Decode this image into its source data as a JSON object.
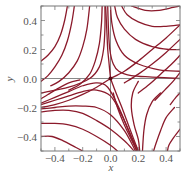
{
  "chart_data": {
    "type": "line",
    "title": "",
    "xlabel": "x",
    "ylabel": "y",
    "xlim": [
      -0.5,
      0.5
    ],
    "ylim": [
      -0.5,
      0.5
    ],
    "grid": false,
    "legend": null,
    "xticks": [
      -0.4,
      -0.2,
      0.0,
      0.2,
      0.4
    ],
    "xtick_labels": [
      "−0.4",
      "−0.2",
      "0.0",
      "0.2",
      "0.4"
    ],
    "yticks": [
      -0.4,
      -0.2,
      0.0,
      0.2,
      0.4
    ],
    "ytick_labels": [
      "−0.4",
      "−0.2",
      "0.0",
      "0.2",
      "0.4"
    ],
    "minor_tick_step": 0.1,
    "reference_lines": [
      {
        "orientation": "horizontal",
        "value": 0.0
      },
      {
        "orientation": "vertical",
        "value": 0.0
      }
    ],
    "fixed_point": {
      "x": 0.0,
      "y": 0.0,
      "kind": "saddle"
    },
    "series": [
      {
        "name": "traj-upper-left-1",
        "points": [
          [
            -0.5,
            -0.02
          ],
          [
            -0.45,
            0.02
          ],
          [
            -0.4,
            0.08
          ],
          [
            -0.35,
            0.16
          ],
          [
            -0.31,
            0.26
          ],
          [
            -0.28,
            0.38
          ],
          [
            -0.26,
            0.5
          ]
        ]
      },
      {
        "name": "traj-upper-left-2",
        "points": [
          [
            -0.43,
            -0.05
          ],
          [
            -0.37,
            -0.02
          ],
          [
            -0.3,
            0.04
          ],
          [
            -0.24,
            0.12
          ],
          [
            -0.2,
            0.22
          ],
          [
            -0.17,
            0.34
          ],
          [
            -0.15,
            0.5
          ]
        ]
      },
      {
        "name": "traj-upper-left-3",
        "points": [
          [
            -0.3,
            -0.08
          ],
          [
            -0.22,
            -0.04
          ],
          [
            -0.15,
            0.03
          ],
          [
            -0.11,
            0.12
          ],
          [
            -0.08,
            0.24
          ],
          [
            -0.065,
            0.38
          ],
          [
            -0.06,
            0.5
          ]
        ]
      },
      {
        "name": "traj-upper-left-4",
        "points": [
          [
            -0.5,
            0.12
          ],
          [
            -0.45,
            0.16
          ],
          [
            -0.4,
            0.22
          ],
          [
            -0.36,
            0.3
          ],
          [
            -0.33,
            0.4
          ],
          [
            -0.31,
            0.5
          ]
        ]
      },
      {
        "name": "traj-stable-manifold-top",
        "points": [
          [
            0.0,
            0.0
          ],
          [
            -0.01,
            0.1
          ],
          [
            -0.02,
            0.2
          ],
          [
            -0.025,
            0.3
          ],
          [
            -0.03,
            0.4
          ],
          [
            -0.035,
            0.5
          ]
        ]
      },
      {
        "name": "traj-near-manifold-left",
        "points": [
          [
            -0.04,
            0.5
          ],
          [
            -0.04,
            0.35
          ],
          [
            -0.05,
            0.2
          ],
          [
            -0.08,
            0.08
          ],
          [
            -0.15,
            0.0
          ],
          [
            -0.3,
            -0.06
          ],
          [
            -0.5,
            -0.1
          ]
        ]
      },
      {
        "name": "traj-near-manifold-right",
        "points": [
          [
            -0.02,
            0.5
          ],
          [
            -0.015,
            0.35
          ],
          [
            -0.005,
            0.2
          ],
          [
            0.02,
            0.1
          ],
          [
            0.06,
            0.05
          ],
          [
            0.15,
            0.02
          ],
          [
            0.3,
            0.01
          ],
          [
            0.5,
            0.0
          ]
        ]
      },
      {
        "name": "traj-upper-right-1",
        "points": [
          [
            0.0,
            0.5
          ],
          [
            0.01,
            0.38
          ],
          [
            0.04,
            0.26
          ],
          [
            0.1,
            0.16
          ],
          [
            0.2,
            0.1
          ],
          [
            0.35,
            0.06
          ],
          [
            0.5,
            0.05
          ]
        ]
      },
      {
        "name": "traj-upper-right-2",
        "points": [
          [
            0.03,
            0.5
          ],
          [
            0.05,
            0.42
          ],
          [
            0.1,
            0.34
          ],
          [
            0.18,
            0.27
          ],
          [
            0.3,
            0.22
          ],
          [
            0.42,
            0.2
          ],
          [
            0.5,
            0.2
          ]
        ]
      },
      {
        "name": "traj-upper-right-3",
        "points": [
          [
            0.08,
            0.5
          ],
          [
            0.12,
            0.44
          ],
          [
            0.2,
            0.39
          ],
          [
            0.3,
            0.36
          ],
          [
            0.4,
            0.36
          ],
          [
            0.5,
            0.37
          ]
        ]
      },
      {
        "name": "traj-upper-right-4",
        "points": [
          [
            0.15,
            0.5
          ],
          [
            0.25,
            0.47
          ],
          [
            0.35,
            0.47
          ],
          [
            0.45,
            0.49
          ],
          [
            0.5,
            0.5
          ]
        ]
      },
      {
        "name": "traj-unstable-manifold-right",
        "points": [
          [
            0.0,
            0.0
          ],
          [
            0.1,
            0.05
          ],
          [
            0.2,
            0.12
          ],
          [
            0.3,
            0.2
          ],
          [
            0.4,
            0.28
          ],
          [
            0.5,
            0.37
          ]
        ]
      },
      {
        "name": "traj-right-1",
        "points": [
          [
            0.1,
            -0.03
          ],
          [
            0.2,
            0.03
          ],
          [
            0.3,
            0.1
          ],
          [
            0.4,
            0.18
          ],
          [
            0.5,
            0.27
          ]
        ]
      },
      {
        "name": "traj-right-2",
        "points": [
          [
            0.2,
            -0.1
          ],
          [
            0.28,
            -0.04
          ],
          [
            0.36,
            0.03
          ],
          [
            0.44,
            0.1
          ],
          [
            0.5,
            0.16
          ]
        ]
      },
      {
        "name": "traj-right-3",
        "points": [
          [
            0.32,
            -0.15
          ],
          [
            0.39,
            -0.08
          ],
          [
            0.45,
            -0.02
          ],
          [
            0.5,
            0.04
          ]
        ]
      },
      {
        "name": "traj-right-4",
        "points": [
          [
            0.43,
            -0.18
          ],
          [
            0.47,
            -0.13
          ],
          [
            0.5,
            -0.1
          ]
        ]
      },
      {
        "name": "traj-unstable-manifold-left",
        "points": [
          [
            0.0,
            0.0
          ],
          [
            -0.1,
            -0.06
          ],
          [
            -0.2,
            -0.11
          ],
          [
            -0.3,
            -0.15
          ],
          [
            -0.4,
            -0.18
          ],
          [
            -0.5,
            -0.2
          ]
        ]
      },
      {
        "name": "traj-lower-left-1",
        "points": [
          [
            -0.5,
            -0.18
          ],
          [
            -0.4,
            -0.15
          ],
          [
            -0.3,
            -0.12
          ],
          [
            -0.2,
            -0.09
          ],
          [
            -0.1,
            -0.08
          ],
          [
            0.0,
            -0.12
          ],
          [
            0.08,
            -0.25
          ],
          [
            0.15,
            -0.4
          ],
          [
            0.2,
            -0.5
          ]
        ]
      },
      {
        "name": "traj-lower-left-2",
        "points": [
          [
            -0.5,
            -0.17
          ],
          [
            -0.4,
            -0.13
          ],
          [
            -0.3,
            -0.09
          ],
          [
            -0.2,
            -0.05
          ],
          [
            -0.1,
            -0.03
          ],
          [
            -0.02,
            -0.06
          ],
          [
            0.06,
            -0.2
          ],
          [
            0.13,
            -0.36
          ],
          [
            0.19,
            -0.5
          ]
        ]
      },
      {
        "name": "traj-lower-left-3",
        "points": [
          [
            -0.5,
            -0.21
          ],
          [
            -0.4,
            -0.2
          ],
          [
            -0.3,
            -0.19
          ],
          [
            -0.2,
            -0.19
          ],
          [
            -0.1,
            -0.2
          ],
          [
            0.0,
            -0.25
          ],
          [
            0.1,
            -0.36
          ],
          [
            0.18,
            -0.5
          ]
        ]
      },
      {
        "name": "traj-lower-left-4",
        "points": [
          [
            -0.5,
            -0.23
          ],
          [
            -0.4,
            -0.22
          ],
          [
            -0.3,
            -0.22
          ],
          [
            -0.2,
            -0.24
          ],
          [
            -0.1,
            -0.29
          ],
          [
            0.0,
            -0.35
          ],
          [
            0.1,
            -0.43
          ],
          [
            0.17,
            -0.5
          ]
        ]
      },
      {
        "name": "traj-lower-left-5",
        "points": [
          [
            -0.5,
            -0.31
          ],
          [
            -0.4,
            -0.31
          ],
          [
            -0.3,
            -0.32
          ],
          [
            -0.2,
            -0.35
          ],
          [
            -0.1,
            -0.4
          ],
          [
            0.0,
            -0.46
          ],
          [
            0.05,
            -0.5
          ]
        ]
      },
      {
        "name": "traj-lower-left-6",
        "points": [
          [
            -0.5,
            -0.4
          ],
          [
            -0.42,
            -0.4
          ],
          [
            -0.34,
            -0.43
          ],
          [
            -0.26,
            -0.47
          ],
          [
            -0.2,
            -0.5
          ]
        ]
      },
      {
        "name": "traj-lower-left-7",
        "points": [
          [
            -0.5,
            -0.14
          ],
          [
            -0.45,
            -0.11
          ],
          [
            -0.38,
            -0.07
          ],
          [
            -0.3,
            -0.03
          ],
          [
            -0.22,
            -0.01
          ]
        ]
      },
      {
        "name": "traj-stable-manifold-bottom",
        "points": [
          [
            0.0,
            0.0
          ],
          [
            0.04,
            -0.1
          ],
          [
            0.09,
            -0.22
          ],
          [
            0.14,
            -0.35
          ],
          [
            0.2,
            -0.5
          ]
        ]
      },
      {
        "name": "traj-lower-right-1",
        "points": [
          [
            0.02,
            -0.1
          ],
          [
            0.05,
            -0.2
          ],
          [
            0.1,
            -0.32
          ],
          [
            0.15,
            -0.42
          ],
          [
            0.19,
            -0.5
          ]
        ]
      },
      {
        "name": "traj-lower-right-2",
        "points": [
          [
            0.2,
            -0.02
          ],
          [
            0.16,
            -0.1
          ],
          [
            0.15,
            -0.2
          ],
          [
            0.17,
            -0.32
          ],
          [
            0.2,
            -0.42
          ],
          [
            0.21,
            -0.5
          ]
        ]
      },
      {
        "name": "traj-lower-right-3",
        "points": [
          [
            0.36,
            -0.1
          ],
          [
            0.3,
            -0.16
          ],
          [
            0.26,
            -0.25
          ],
          [
            0.24,
            -0.36
          ],
          [
            0.23,
            -0.5
          ]
        ]
      },
      {
        "name": "traj-lower-right-4",
        "points": [
          [
            0.46,
            -0.2
          ],
          [
            0.4,
            -0.27
          ],
          [
            0.36,
            -0.36
          ],
          [
            0.33,
            -0.44
          ],
          [
            0.31,
            -0.5
          ]
        ]
      },
      {
        "name": "traj-lower-right-5",
        "points": [
          [
            0.5,
            -0.35
          ],
          [
            0.46,
            -0.4
          ],
          [
            0.42,
            -0.46
          ],
          [
            0.41,
            -0.5
          ]
        ]
      }
    ]
  },
  "style": {
    "line_color": "#8b1a2b",
    "axis_color": "#777777",
    "reference_line_color": "#888888",
    "text_color": "#555555",
    "fixed_point_color": "#5a0a14"
  }
}
